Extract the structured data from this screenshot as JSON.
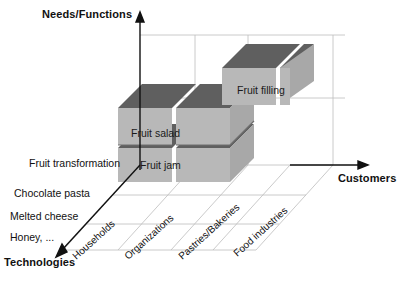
{
  "diagram": {
    "type": "abell-3d-business-model",
    "axes": {
      "y": {
        "label": "Needs/Functions",
        "direction": "up",
        "arrow": true
      },
      "x": {
        "label": "Customers",
        "direction": "right",
        "arrow": true
      },
      "z": {
        "label": "Technologies",
        "direction": "down-left",
        "arrow": true
      }
    },
    "technologies": [
      "Fruit transformation",
      "Chocolate pasta",
      "Melted cheese",
      "Honey, ..."
    ],
    "customers": [
      "Households",
      "Organizations",
      "Pastries/Bakeries",
      "Food industries"
    ],
    "blocks": [
      {
        "label": "Fruit salad",
        "level": "middle",
        "cells": 2
      },
      {
        "label": "Fruit jam",
        "level": "low",
        "cells": 2
      },
      {
        "label": "Fruit filling",
        "level": "high",
        "cells": 2
      }
    ],
    "colors": {
      "block_top": "#5f5f5f",
      "block_front": "#b8b8b8",
      "block_side": "#9a9a9a",
      "grid": "#b9b9b9",
      "axis": "#1a1a1a",
      "background": "#ffffff"
    }
  }
}
